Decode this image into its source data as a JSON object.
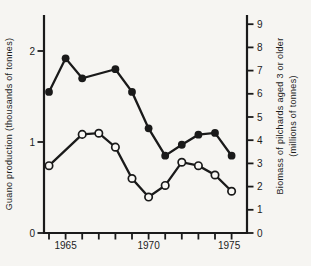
{
  "figure": {
    "background": "#f6f5f2",
    "ink_color": "#1a1a1a",
    "open_marker_fill": "#f9f8f5"
  },
  "chart_data": {
    "type": "line",
    "title": "",
    "x_axis": {
      "range": [
        1964,
        1975
      ],
      "ticks": [
        1964,
        1965,
        1966,
        1967,
        1968,
        1969,
        1970,
        1971,
        1972,
        1973,
        1974,
        1975
      ],
      "labeled_ticks": [
        "1965",
        "1970",
        "1975"
      ]
    },
    "left_axis": {
      "label": "Guano production (thousands of tonnes)",
      "ticks": [
        0,
        1,
        2
      ],
      "range": [
        0,
        2.4
      ]
    },
    "right_axis": {
      "label_line1": "Biomass of pilchards aged 3 or older",
      "label_line2": "(millions of tonnes)",
      "ticks": [
        0,
        1,
        2,
        3,
        4,
        5,
        6,
        7,
        8,
        9
      ],
      "range": [
        0,
        9.4
      ]
    },
    "legend": "none",
    "grid": false,
    "series": [
      {
        "id": "guano-production",
        "name": "Guano production",
        "axis": "left",
        "marker": "filled-circle",
        "points": [
          [
            1964,
            1.55
          ],
          [
            1965,
            1.92
          ],
          [
            1966,
            1.7
          ],
          [
            1968,
            1.8
          ],
          [
            1969,
            1.55
          ],
          [
            1970,
            1.15
          ],
          [
            1971,
            0.85
          ],
          [
            1972,
            0.97
          ],
          [
            1973,
            1.08
          ],
          [
            1974,
            1.1
          ],
          [
            1975,
            0.85
          ]
        ]
      },
      {
        "id": "pilchard-biomass",
        "name": "Biomass of pilchards aged 3 or older",
        "axis": "right",
        "marker": "open-circle",
        "points": [
          [
            1964,
            2.9
          ],
          [
            1966,
            4.25
          ],
          [
            1967,
            4.3
          ],
          [
            1968,
            3.7
          ],
          [
            1969,
            2.35
          ],
          [
            1970,
            1.55
          ],
          [
            1971,
            2.05
          ],
          [
            1972,
            3.05
          ],
          [
            1973,
            2.9
          ],
          [
            1974,
            2.5
          ],
          [
            1975,
            1.8
          ]
        ]
      }
    ]
  }
}
